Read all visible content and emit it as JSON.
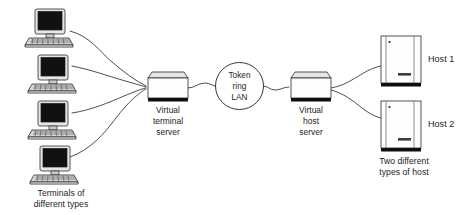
{
  "diagram": {
    "background_color": "#ffffff",
    "line_color": "#3a3a3a",
    "text_color": "#1b1b1b"
  },
  "terminals": {
    "group_caption_line1": "Terminals of",
    "group_caption_line2": "different types",
    "count": 4,
    "items": [
      {
        "id": "terminal-1",
        "screen": "dark"
      },
      {
        "id": "terminal-2",
        "screen": "dark"
      },
      {
        "id": "terminal-3",
        "screen": "dark"
      },
      {
        "id": "terminal-4",
        "screen": "dark"
      }
    ]
  },
  "terminal_server": {
    "label_line1": "Virtual",
    "label_line2": "terminal",
    "label_line3": "server"
  },
  "lan": {
    "label_line1": "Token",
    "label_line2": "ring",
    "label_line3": "LAN"
  },
  "host_server": {
    "label_line1": "Virtual",
    "label_line2": "host",
    "label_line3": "server"
  },
  "hosts": {
    "group_caption_line1": "Two different",
    "group_caption_line2": "types of host",
    "items": [
      {
        "id": "host-1",
        "label": "Host 1"
      },
      {
        "id": "host-2",
        "label": "Host 2"
      }
    ]
  }
}
